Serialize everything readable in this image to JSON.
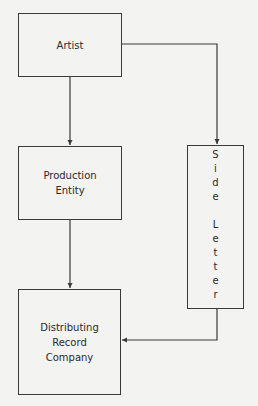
{
  "diagram": {
    "nodes": {
      "artist": {
        "lines": [
          "Artist"
        ]
      },
      "production": {
        "lines": [
          "Production",
          "Entity"
        ]
      },
      "distributing": {
        "lines": [
          "Distributing",
          "Record",
          "Company"
        ]
      },
      "side_letter": {
        "label": "Side Letter",
        "letters": [
          "S",
          "i",
          "d",
          "e",
          "",
          "L",
          "e",
          "t",
          "t",
          "e",
          "r"
        ]
      }
    },
    "edges": [
      {
        "from": "Artist",
        "to": "Production Entity"
      },
      {
        "from": "Artist",
        "to": "Side Letter"
      },
      {
        "from": "Production Entity",
        "to": "Distributing Record Company"
      },
      {
        "from": "Side Letter",
        "to": "Distributing Record Company"
      }
    ],
    "colors": {
      "line": "#3a3a3a",
      "background": "#f3f3f1",
      "text": "#2a2a2a"
    }
  }
}
